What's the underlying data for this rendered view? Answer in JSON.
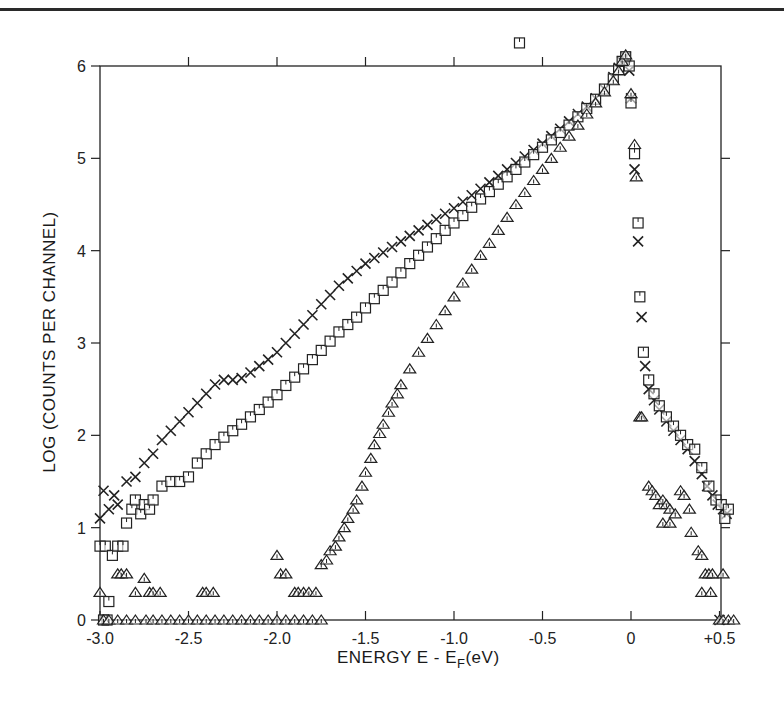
{
  "chart_data": {
    "type": "scatter",
    "title": "",
    "xlabel": "ENERGY E - E_F(eV)",
    "xlabel_main": "ENERGY E - E",
    "xlabel_sub": "F",
    "xlabel_unit": "(eV)",
    "ylabel": "LOG (COUNTS PER CHANNEL)",
    "xlim": [
      -3.0,
      0.5
    ],
    "ylim": [
      0,
      6
    ],
    "x_ticks": [
      -3.0,
      -2.5,
      -2.0,
      -1.5,
      -1.0,
      -0.5,
      0,
      0.5
    ],
    "x_tick_labels": [
      "-3.0",
      "-2.5",
      "-2.0",
      "-1.5",
      "-1.0",
      "-0.5",
      "0",
      "+0.5"
    ],
    "y_ticks": [
      0,
      1,
      2,
      3,
      4,
      5,
      6
    ],
    "y_tick_labels": [
      "0",
      "1",
      "2",
      "3",
      "4",
      "5",
      "6"
    ],
    "grid": false,
    "legend": "none",
    "series": [
      {
        "name": "crosses",
        "marker": "x",
        "points": [
          [
            -3.0,
            1.1
          ],
          [
            -2.98,
            1.4
          ],
          [
            -2.95,
            1.2
          ],
          [
            -2.92,
            1.35
          ],
          [
            -2.9,
            1.25
          ],
          [
            -2.85,
            1.5
          ],
          [
            -2.8,
            1.55
          ],
          [
            -2.75,
            1.7
          ],
          [
            -2.7,
            1.8
          ],
          [
            -2.65,
            1.95
          ],
          [
            -2.6,
            2.05
          ],
          [
            -2.55,
            2.15
          ],
          [
            -2.5,
            2.25
          ],
          [
            -2.45,
            2.35
          ],
          [
            -2.4,
            2.45
          ],
          [
            -2.35,
            2.55
          ],
          [
            -2.3,
            2.6
          ],
          [
            -2.25,
            2.6
          ],
          [
            -2.2,
            2.62
          ],
          [
            -2.15,
            2.68
          ],
          [
            -2.1,
            2.75
          ],
          [
            -2.05,
            2.82
          ],
          [
            -2.0,
            2.9
          ],
          [
            -1.95,
            3.0
          ],
          [
            -1.9,
            3.1
          ],
          [
            -1.85,
            3.2
          ],
          [
            -1.8,
            3.3
          ],
          [
            -1.75,
            3.42
          ],
          [
            -1.7,
            3.52
          ],
          [
            -1.65,
            3.62
          ],
          [
            -1.6,
            3.7
          ],
          [
            -1.55,
            3.78
          ],
          [
            -1.5,
            3.86
          ],
          [
            -1.45,
            3.92
          ],
          [
            -1.4,
            3.98
          ],
          [
            -1.35,
            4.04
          ],
          [
            -1.3,
            4.1
          ],
          [
            -1.25,
            4.16
          ],
          [
            -1.2,
            4.22
          ],
          [
            -1.15,
            4.28
          ],
          [
            -1.1,
            4.34
          ],
          [
            -1.05,
            4.4
          ],
          [
            -1.0,
            4.46
          ],
          [
            -0.95,
            4.53
          ],
          [
            -0.9,
            4.6
          ],
          [
            -0.85,
            4.67
          ],
          [
            -0.8,
            4.74
          ],
          [
            -0.75,
            4.81
          ],
          [
            -0.7,
            4.88
          ],
          [
            -0.65,
            4.95
          ],
          [
            -0.6,
            5.02
          ],
          [
            -0.55,
            5.09
          ],
          [
            -0.5,
            5.16
          ],
          [
            -0.45,
            5.24
          ],
          [
            -0.4,
            5.32
          ],
          [
            -0.35,
            5.4
          ],
          [
            -0.3,
            5.48
          ],
          [
            -0.25,
            5.56
          ],
          [
            -0.2,
            5.65
          ],
          [
            -0.15,
            5.75
          ],
          [
            -0.1,
            5.88
          ],
          [
            -0.07,
            5.98
          ],
          [
            -0.05,
            6.05
          ],
          [
            -0.03,
            6.1
          ],
          [
            -0.01,
            5.95
          ],
          [
            0.0,
            5.65
          ],
          [
            0.02,
            4.88
          ],
          [
            0.04,
            4.1
          ],
          [
            0.06,
            3.28
          ],
          [
            0.08,
            2.75
          ],
          [
            0.1,
            2.5
          ],
          [
            0.13,
            2.38
          ],
          [
            0.16,
            2.28
          ],
          [
            0.2,
            2.15
          ],
          [
            0.24,
            2.05
          ],
          [
            0.28,
            1.95
          ],
          [
            0.32,
            1.85
          ],
          [
            0.36,
            1.72
          ],
          [
            0.4,
            1.58
          ],
          [
            0.43,
            1.45
          ],
          [
            0.46,
            1.35
          ],
          [
            0.49,
            1.25
          ],
          [
            0.52,
            1.2
          ],
          [
            0.54,
            1.15
          ],
          [
            0.5,
            0.0
          ]
        ]
      },
      {
        "name": "squares",
        "marker": "square",
        "points": [
          [
            -3.0,
            0.8
          ],
          [
            -2.97,
            0.8
          ],
          [
            -2.95,
            0.2
          ],
          [
            -2.93,
            0.7
          ],
          [
            -2.9,
            0.8
          ],
          [
            -2.87,
            0.8
          ],
          [
            -2.85,
            1.05
          ],
          [
            -2.82,
            1.2
          ],
          [
            -2.8,
            1.3
          ],
          [
            -2.77,
            1.15
          ],
          [
            -2.75,
            1.25
          ],
          [
            -2.72,
            1.2
          ],
          [
            -2.7,
            1.3
          ],
          [
            -2.65,
            1.45
          ],
          [
            -2.6,
            1.5
          ],
          [
            -2.55,
            1.5
          ],
          [
            -2.5,
            1.55
          ],
          [
            -2.45,
            1.7
          ],
          [
            -2.4,
            1.8
          ],
          [
            -2.35,
            1.9
          ],
          [
            -2.3,
            1.98
          ],
          [
            -2.25,
            2.05
          ],
          [
            -2.2,
            2.12
          ],
          [
            -2.15,
            2.2
          ],
          [
            -2.1,
            2.28
          ],
          [
            -2.05,
            2.36
          ],
          [
            -2.0,
            2.44
          ],
          [
            -1.95,
            2.54
          ],
          [
            -1.9,
            2.63
          ],
          [
            -1.85,
            2.72
          ],
          [
            -1.8,
            2.82
          ],
          [
            -1.75,
            2.92
          ],
          [
            -1.7,
            3.02
          ],
          [
            -1.65,
            3.12
          ],
          [
            -1.6,
            3.2
          ],
          [
            -1.55,
            3.28
          ],
          [
            -1.5,
            3.38
          ],
          [
            -1.45,
            3.48
          ],
          [
            -1.4,
            3.57
          ],
          [
            -1.35,
            3.66
          ],
          [
            -1.3,
            3.76
          ],
          [
            -1.25,
            3.86
          ],
          [
            -1.2,
            3.95
          ],
          [
            -1.15,
            4.04
          ],
          [
            -1.1,
            4.13
          ],
          [
            -1.05,
            4.22
          ],
          [
            -1.0,
            4.3
          ],
          [
            -0.95,
            4.38
          ],
          [
            -0.9,
            4.47
          ],
          [
            -0.85,
            4.56
          ],
          [
            -0.8,
            4.64
          ],
          [
            -0.75,
            4.72
          ],
          [
            -0.7,
            4.8
          ],
          [
            -0.65,
            4.88
          ],
          [
            -0.6,
            4.96
          ],
          [
            -0.55,
            5.04
          ],
          [
            -0.5,
            5.12
          ],
          [
            -0.45,
            5.2
          ],
          [
            -0.4,
            5.28
          ],
          [
            -0.35,
            5.36
          ],
          [
            -0.3,
            5.45
          ],
          [
            -0.25,
            5.54
          ],
          [
            -0.2,
            5.64
          ],
          [
            -0.15,
            5.75
          ],
          [
            -0.1,
            5.86
          ],
          [
            -0.07,
            5.96
          ],
          [
            -0.05,
            6.05
          ],
          [
            -0.03,
            6.1
          ],
          [
            -0.01,
            6.0
          ],
          [
            -0.63,
            6.25
          ],
          [
            0.0,
            5.6
          ],
          [
            0.02,
            5.05
          ],
          [
            0.04,
            4.3
          ],
          [
            0.05,
            3.5
          ],
          [
            0.07,
            2.9
          ],
          [
            0.1,
            2.6
          ],
          [
            0.13,
            2.45
          ],
          [
            0.16,
            2.32
          ],
          [
            0.2,
            2.2
          ],
          [
            0.24,
            2.1
          ],
          [
            0.28,
            2.0
          ],
          [
            0.32,
            1.9
          ],
          [
            0.36,
            1.85
          ],
          [
            0.4,
            1.65
          ],
          [
            0.44,
            1.45
          ],
          [
            0.48,
            1.3
          ],
          [
            0.51,
            1.25
          ],
          [
            0.53,
            1.1
          ],
          [
            0.55,
            1.2
          ],
          [
            -2.98,
            0.0
          ],
          [
            -2.96,
            0.0
          ]
        ]
      },
      {
        "name": "triangles",
        "marker": "triangle",
        "points": [
          [
            -3.0,
            0.3
          ],
          [
            -2.9,
            0.5
          ],
          [
            -2.88,
            0.5
          ],
          [
            -2.85,
            0.5
          ],
          [
            -2.8,
            0.3
          ],
          [
            -2.75,
            0.45
          ],
          [
            -2.72,
            0.3
          ],
          [
            -2.7,
            0.3
          ],
          [
            -2.66,
            0.3
          ],
          [
            -2.42,
            0.3
          ],
          [
            -2.4,
            0.3
          ],
          [
            -2.36,
            0.3
          ],
          [
            -2.0,
            0.7
          ],
          [
            -1.98,
            0.5
          ],
          [
            -1.95,
            0.5
          ],
          [
            -1.9,
            0.3
          ],
          [
            -1.88,
            0.3
          ],
          [
            -1.85,
            0.3
          ],
          [
            -1.82,
            0.3
          ],
          [
            -1.78,
            0.3
          ],
          [
            -2.98,
            0.0
          ],
          [
            -2.95,
            0.0
          ],
          [
            -2.9,
            0.0
          ],
          [
            -2.85,
            0.0
          ],
          [
            -2.8,
            0.0
          ],
          [
            -2.74,
            0.0
          ],
          [
            -2.7,
            0.0
          ],
          [
            -2.65,
            0.0
          ],
          [
            -2.6,
            0.0
          ],
          [
            -2.55,
            0.0
          ],
          [
            -2.5,
            0.0
          ],
          [
            -2.45,
            0.0
          ],
          [
            -2.4,
            0.0
          ],
          [
            -2.35,
            0.0
          ],
          [
            -2.3,
            0.0
          ],
          [
            -2.25,
            0.0
          ],
          [
            -2.2,
            0.0
          ],
          [
            -2.15,
            0.0
          ],
          [
            -2.1,
            0.0
          ],
          [
            -2.05,
            0.0
          ],
          [
            -2.0,
            0.0
          ],
          [
            -1.95,
            0.0
          ],
          [
            -1.9,
            0.0
          ],
          [
            -1.85,
            0.0
          ],
          [
            -1.8,
            0.0
          ],
          [
            -1.75,
            0.0
          ],
          [
            -1.75,
            0.6
          ],
          [
            -1.72,
            0.65
          ],
          [
            -1.7,
            0.75
          ],
          [
            -1.67,
            0.8
          ],
          [
            -1.65,
            0.9
          ],
          [
            -1.62,
            1.0
          ],
          [
            -1.6,
            1.1
          ],
          [
            -1.57,
            1.2
          ],
          [
            -1.55,
            1.3
          ],
          [
            -1.52,
            1.45
          ],
          [
            -1.5,
            1.6
          ],
          [
            -1.47,
            1.75
          ],
          [
            -1.45,
            1.9
          ],
          [
            -1.42,
            2.02
          ],
          [
            -1.4,
            2.12
          ],
          [
            -1.37,
            2.25
          ],
          [
            -1.35,
            2.35
          ],
          [
            -1.32,
            2.45
          ],
          [
            -1.3,
            2.55
          ],
          [
            -1.25,
            2.72
          ],
          [
            -1.2,
            2.9
          ],
          [
            -1.15,
            3.05
          ],
          [
            -1.1,
            3.2
          ],
          [
            -1.05,
            3.35
          ],
          [
            -1.0,
            3.5
          ],
          [
            -0.95,
            3.65
          ],
          [
            -0.9,
            3.8
          ],
          [
            -0.85,
            3.95
          ],
          [
            -0.8,
            4.08
          ],
          [
            -0.75,
            4.22
          ],
          [
            -0.7,
            4.36
          ],
          [
            -0.65,
            4.5
          ],
          [
            -0.6,
            4.63
          ],
          [
            -0.55,
            4.76
          ],
          [
            -0.5,
            4.88
          ],
          [
            -0.45,
            5.0
          ],
          [
            -0.4,
            5.12
          ],
          [
            -0.35,
            5.24
          ],
          [
            -0.3,
            5.36
          ],
          [
            -0.25,
            5.48
          ],
          [
            -0.2,
            5.6
          ],
          [
            -0.15,
            5.72
          ],
          [
            -0.1,
            5.84
          ],
          [
            -0.07,
            5.95
          ],
          [
            -0.05,
            6.05
          ],
          [
            -0.03,
            6.12
          ],
          [
            0.0,
            5.7
          ],
          [
            0.02,
            5.15
          ],
          [
            0.03,
            4.8
          ],
          [
            0.05,
            2.2
          ],
          [
            0.06,
            2.2
          ],
          [
            0.1,
            1.45
          ],
          [
            0.12,
            1.4
          ],
          [
            0.14,
            1.35
          ],
          [
            0.16,
            1.25
          ],
          [
            0.18,
            1.3
          ],
          [
            0.2,
            1.25
          ],
          [
            0.22,
            1.2
          ],
          [
            0.25,
            1.15
          ],
          [
            0.28,
            1.4
          ],
          [
            0.3,
            1.35
          ],
          [
            0.33,
            1.2
          ],
          [
            0.18,
            1.05
          ],
          [
            0.22,
            1.05
          ],
          [
            0.34,
            0.95
          ],
          [
            0.38,
            0.75
          ],
          [
            0.4,
            0.7
          ],
          [
            0.42,
            0.5
          ],
          [
            0.44,
            0.5
          ],
          [
            0.46,
            0.5
          ],
          [
            0.52,
            0.5
          ],
          [
            0.4,
            0.3
          ],
          [
            0.45,
            0.3
          ],
          [
            0.5,
            0.0
          ],
          [
            0.52,
            0.0
          ],
          [
            0.55,
            0.0
          ],
          [
            0.58,
            0.0
          ]
        ]
      }
    ]
  },
  "axes": {
    "ylabel": "LOG (COUNTS PER CHANNEL)",
    "xlabel_main": "ENERGY E - E",
    "xlabel_sub": "F",
    "xlabel_unit": "(eV)"
  }
}
